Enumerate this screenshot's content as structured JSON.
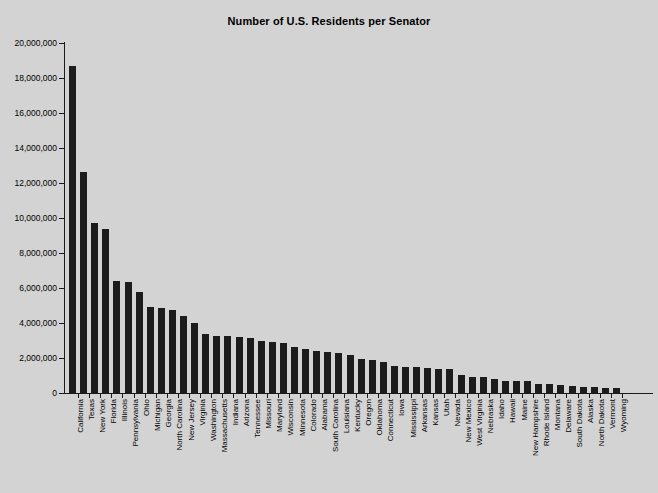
{
  "chart_data": {
    "type": "bar",
    "title": "Number of U.S. Residents per Senator",
    "xlabel": "",
    "ylabel": "",
    "ylim": [
      0,
      20000000
    ],
    "ytick_step": 2000000,
    "grid": false,
    "legend": null,
    "bar_color": "#1c1c1c",
    "background_color": "#d3d3d3",
    "ytick_labels": [
      "20,000,000",
      "18,000,000",
      "16,000,000",
      "14,000,000",
      "12,000,000",
      "10,000,000",
      "8,000,000",
      "6,000,000",
      "4,000,000",
      "2,000,000",
      "0"
    ],
    "ytick_values": [
      20000000,
      18000000,
      16000000,
      14000000,
      12000000,
      10000000,
      8000000,
      6000000,
      4000000,
      2000000,
      0
    ],
    "categories": [
      "California",
      "Texas",
      "New York",
      "Florida",
      "Illinois",
      "Pennsylvania",
      "Ohio",
      "Michigan",
      "Georgia",
      "North Carolina",
      "New Jersey",
      "Virginia",
      "Washington",
      "Massachusetts",
      "Indiana",
      "Arizona",
      "Tennessee",
      "Missouri",
      "Maryland",
      "Wisconsin",
      "Minnesota",
      "Colorado",
      "Alabama",
      "South Carolina",
      "Louisiana",
      "Kentucky",
      "Oregon",
      "Oklahoma",
      "Connecticut",
      "Iowa",
      "Mississippi",
      "Arkansas",
      "Kansas",
      "Utah",
      "Nevada",
      "New Mexico",
      "West Virginia",
      "Nebraska",
      "Idaho",
      "Hawaii",
      "Maine",
      "New Hampshire",
      "Rhode Island",
      "Montana",
      "Delaware",
      "South Dakota",
      "Alaska",
      "North Dakota",
      "Vermont",
      "Wyoming"
    ],
    "values": [
      18680000,
      12630000,
      9690000,
      9400000,
      6420000,
      6360000,
      5770000,
      4940000,
      4840000,
      4770000,
      4400000,
      4000000,
      3370000,
      3280000,
      3250000,
      3200000,
      3170000,
      3000000,
      2890000,
      2850000,
      2650000,
      2520000,
      2390000,
      2320000,
      2270000,
      2170000,
      1920000,
      1880000,
      1790000,
      1520000,
      1480000,
      1460000,
      1430000,
      1380000,
      1350000,
      1030000,
      930000,
      910000,
      780000,
      680000,
      660000,
      660000,
      530000,
      500000,
      450000,
      410000,
      360000,
      340000,
      310000,
      280000
    ]
  }
}
